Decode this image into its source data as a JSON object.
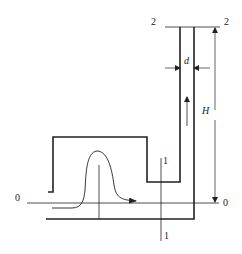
{
  "diagram": {
    "type": "fluid-flow-schematic",
    "section_labels": {
      "s0_left": "0",
      "s0_right": "0",
      "s1_top": "1",
      "s1_bottom": "1",
      "s2_left": "2",
      "s2_right": "2"
    },
    "dimension_labels": {
      "diameter": "d",
      "height": "H"
    },
    "colors": {
      "stroke": "#222222",
      "background": "#ffffff"
    }
  }
}
